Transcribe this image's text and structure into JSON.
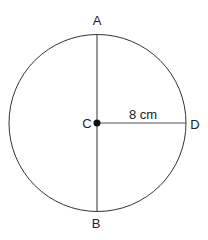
{
  "diagram": {
    "points": {
      "A": "A",
      "B": "B",
      "C": "C",
      "D": "D"
    },
    "radius_label": "8 cm",
    "colors": {
      "stroke": "#333333",
      "background": "#ffffff"
    }
  }
}
